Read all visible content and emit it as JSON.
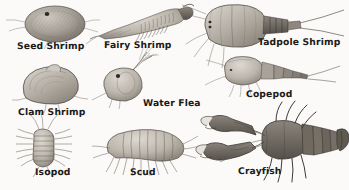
{
  "plate": {
    "title": "Freshwater Crustaceans Illustration Plate",
    "style": "grayscale pen-and-ink scientific illustration",
    "background_color": "#fbfaf8",
    "ink_color": "#4a453f",
    "label_color": "#1c1b19",
    "width": 349,
    "height": 190
  },
  "specimens": [
    {
      "id": "seed-shrimp",
      "label": "Seed Shrimp",
      "position": "top-left",
      "description": "oval hairy bivalved body with dark eye spot and short antennae"
    },
    {
      "id": "fairy-shrimp",
      "label": "Fairy Shrimp",
      "position": "top-center",
      "description": "elongate body with rows of leaf-like swimming legs and curved head"
    },
    {
      "id": "tadpole-shrimp",
      "label": "Tadpole Shrimp",
      "position": "top-right",
      "description": "broad shield-shaped carapace with segmented abdomen and two long cerci"
    },
    {
      "id": "copepod",
      "label": "Copepod",
      "position": "middle-right",
      "description": "teardrop body with segmented tapering tail, long caudal setae and antennae"
    },
    {
      "id": "clam-shrimp",
      "label": "Clam Shrimp",
      "position": "middle-left",
      "description": "rounded clam-like bivalved shell with growth lines"
    },
    {
      "id": "water-flea",
      "label": "Water Flea",
      "position": "middle-center",
      "description": "rounded daphnia body with large branched feathery antennae"
    },
    {
      "id": "isopod",
      "label": "Isopod",
      "position": "bottom-left",
      "description": "flattened segmented body with many lateral legs and antennae"
    },
    {
      "id": "scud",
      "label": "Scud",
      "position": "bottom-center",
      "description": "laterally compressed curved amphipod body with many legs"
    },
    {
      "id": "crayfish",
      "label": "Crayfish",
      "position": "bottom-right",
      "description": "large lobster-like body with two big pincer claws, walking legs and fan tail"
    }
  ]
}
